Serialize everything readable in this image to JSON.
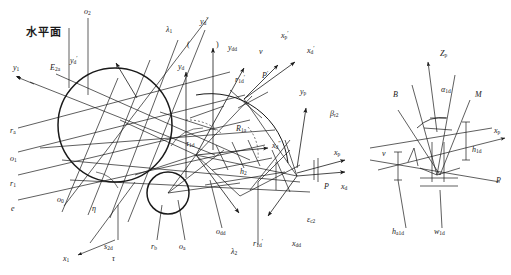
{
  "figure": {
    "title_cjk": "水平面",
    "colors": {
      "line": "#1a1a1a",
      "text": "#1a1a1a",
      "background": "#ffffff"
    }
  },
  "labels": {
    "horizontal_plane": "水平面",
    "o2": "o",
    "o2_sub": "2",
    "yd_prime": "y",
    "yd_prime_sub": "d",
    "yd_prime_sup": "′",
    "lambda1": "λ",
    "lambda1_sub": "1",
    "yd_dprime": "y",
    "yd_dprime_sub": "d",
    "yd_dprime_sup": "″",
    "paren_left": "(",
    "paren_right": ")",
    "ydd": "y",
    "ydd_sub": "dd",
    "y1": "y",
    "y1_sub": "1",
    "E2a": "E",
    "E2a_sub": "2a",
    "yd": "y",
    "yd_sub": "d",
    "r1d_prime_top": "r",
    "r1d_prime_top_sub": "1d",
    "r1d_prime_top_sup": "′",
    "v_top": "v",
    "xp_prime": "x",
    "xp_prime_sub": "p",
    "xp_prime_sup": "′",
    "xd_prime": "x",
    "xd_prime_sub": "d",
    "xd_prime_sup": "′",
    "Pprime": "P",
    "Pprime_sup": "′",
    "yp": "y",
    "yp_sub": "p",
    "beta_r2": "β",
    "beta_r2_sub": "r2",
    "R1a": "R",
    "R1a_sub": "1a",
    "ra": "r",
    "ra_sub": "a",
    "o1": "o",
    "o1_sub": "1",
    "r1": "r",
    "r1_sub": "1",
    "e": "e",
    "tau_1d": "τ",
    "tau_1d_sub": "1d",
    "xd_dprime": "x",
    "xd_dprime_sub": "d",
    "xd_dprime_sup": "″",
    "h2": "h",
    "h2_sub": "2",
    "o0": "o",
    "o0_sub": "0",
    "eta": "η",
    "x1": "x",
    "x1_sub": "1",
    "tau": "τ",
    "s2d": "s",
    "s2d_sub": "2d",
    "rb": "r",
    "rb_sub": "b",
    "oa": "o",
    "oa_sub": "a",
    "odd": "o",
    "odd_sub": "dd",
    "lambda2": "λ",
    "lambda2_sub": "2",
    "r1d_prime_bot": "r",
    "r1d_prime_bot_sub": "1d",
    "r1d_prime_bot_sup": "′",
    "xdd": "x",
    "xdd_sub": "dd",
    "epsilon_c2": "ε",
    "epsilon_c2_sub": "c2",
    "P_left": "P",
    "xp_left": "x",
    "xp_left_sub": "p",
    "v_mid": "v",
    "xd_mid": "x",
    "xd_mid_sub": "d",
    "Zp": "Z",
    "Zp_sub": "p",
    "B": "B",
    "alpha_1d": "α",
    "alpha_1d_sub": "1d",
    "M": "M",
    "xp_right": "x",
    "xp_right_sub": "p",
    "h1d": "h",
    "h1d_sub": "1d",
    "P_right": "P",
    "v_right": "v",
    "ha1d": "h",
    "ha1d_sub": "a1d",
    "w1d": "w",
    "w1d_sub": "1d"
  }
}
